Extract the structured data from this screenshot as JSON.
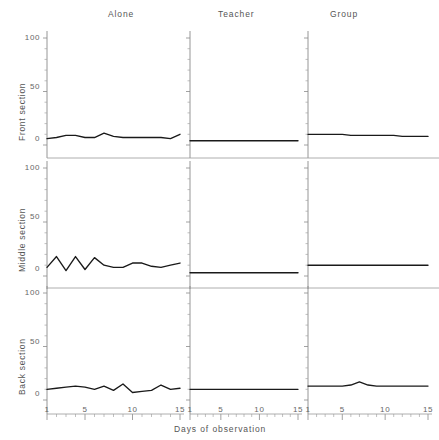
{
  "chart_data": {
    "type": "line",
    "title": "",
    "xlabel": "Days of observation",
    "ylabel": "",
    "xlim": [
      1,
      15
    ],
    "ylim": [
      0,
      100
    ],
    "yticks": [
      0,
      50,
      100
    ],
    "xticks": [
      1,
      5,
      10,
      15
    ],
    "xticks_minor_step": 1,
    "grid": false,
    "legend": null,
    "layout": "3x3 small multiples grid",
    "columns": [
      "Alone",
      "Teacher",
      "Group"
    ],
    "rows": [
      "Front section",
      "Middle section",
      "Back section"
    ],
    "x": [
      1,
      2,
      3,
      4,
      5,
      6,
      7,
      8,
      9,
      10,
      11,
      12,
      13,
      14,
      15
    ],
    "panels": [
      {
        "row": "Front section",
        "column": "Alone",
        "values": [
          6,
          7,
          9,
          9,
          7,
          7,
          11,
          8,
          7,
          7,
          7,
          7,
          7,
          6,
          10
        ]
      },
      {
        "row": "Front section",
        "column": "Teacher",
        "values": [
          4,
          4,
          4,
          4,
          4,
          4,
          4,
          4,
          4,
          4,
          4,
          4,
          4,
          4,
          4
        ]
      },
      {
        "row": "Front section",
        "column": "Group",
        "values": [
          10,
          10,
          10,
          10,
          10,
          9,
          9,
          9,
          9,
          9,
          9,
          8,
          8,
          8,
          8
        ]
      },
      {
        "row": "Middle section",
        "column": "Alone",
        "values": [
          8,
          18,
          5,
          18,
          6,
          17,
          10,
          8,
          8,
          12,
          12,
          9,
          8,
          10,
          12
        ]
      },
      {
        "row": "Middle section",
        "column": "Teacher",
        "values": [
          3,
          3,
          3,
          3,
          3,
          3,
          3,
          3,
          3,
          3,
          3,
          3,
          3,
          3,
          3
        ]
      },
      {
        "row": "Middle section",
        "column": "Group",
        "values": [
          10,
          10,
          10,
          10,
          10,
          10,
          10,
          10,
          10,
          10,
          10,
          10,
          10,
          10,
          10
        ]
      },
      {
        "row": "Back section",
        "column": "Alone",
        "values": [
          10,
          11,
          12,
          13,
          12,
          10,
          13,
          9,
          15,
          7,
          8,
          9,
          14,
          10,
          11
        ]
      },
      {
        "row": "Back section",
        "column": "Teacher",
        "values": [
          10,
          10,
          10,
          10,
          10,
          10,
          10,
          10,
          10,
          10,
          10,
          10,
          10,
          10,
          10
        ]
      },
      {
        "row": "Back section",
        "column": "Group",
        "values": [
          13,
          13,
          13,
          13,
          13,
          14,
          17,
          14,
          13,
          13,
          13,
          13,
          13,
          13,
          13
        ]
      }
    ]
  },
  "figure": {
    "column_titles": [
      "Alone",
      "Teacher",
      "Group"
    ],
    "row_titles": [
      "Front section",
      "Middle section",
      "Back section"
    ],
    "y_tick_labels": [
      "0",
      "50",
      "100"
    ],
    "x_tick_labels": [
      "1",
      "5",
      "10",
      "15"
    ],
    "x_axis_label": "Days of observation",
    "line_color": "#1a1a1a",
    "axis_color": "#8a8a8a",
    "background": "#ffffff"
  }
}
